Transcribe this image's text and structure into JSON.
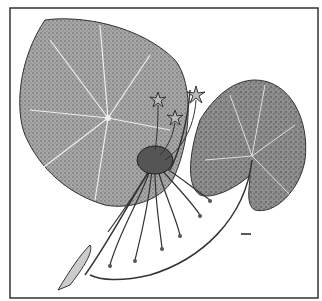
{
  "figure": {
    "frame": {
      "x": 10,
      "y": 8,
      "width": 308,
      "height": 290,
      "stroke": "#333333"
    },
    "scale_bar": {
      "x": 241,
      "y": 233,
      "width": 10
    },
    "colors": {
      "ink": "#2a2a2a",
      "leaf_fill": "#9a9a9a",
      "leaf_light": "#c8c8c8",
      "background": "#ffffff"
    }
  }
}
